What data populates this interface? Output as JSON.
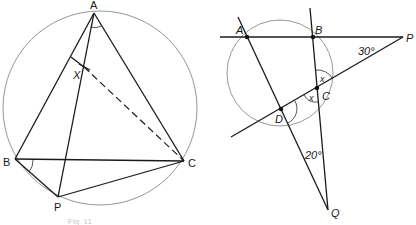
{
  "figure_left": {
    "labels": {
      "A": "A",
      "B": "B",
      "C": "C",
      "P": "P",
      "X": "X"
    },
    "caption": "Fig. 11"
  },
  "figure_right": {
    "labels": {
      "A": "A",
      "B": "B",
      "C": "C",
      "D": "D",
      "P": "P",
      "Q": "Q"
    },
    "angles": {
      "at_P": "30°",
      "at_Q": "20°",
      "x_upper": "x",
      "x_lower": "x"
    }
  }
}
